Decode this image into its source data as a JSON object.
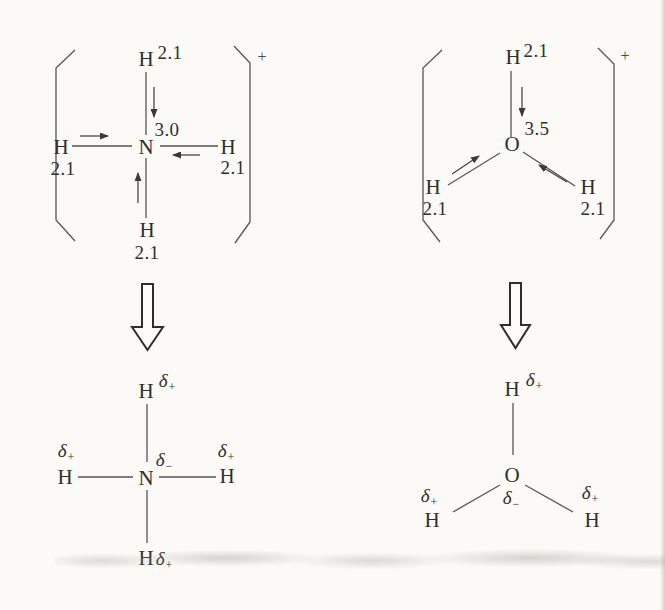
{
  "symbols": {
    "delta": "δ",
    "plus": "+",
    "minus": "−"
  },
  "top_left": {
    "charge": "+",
    "center": "N",
    "center_en": "3.0",
    "h": "H",
    "h_en": "2.1"
  },
  "top_right": {
    "charge": "+",
    "center": "O",
    "center_en": "3.5",
    "h": "H",
    "h_en": "2.1"
  },
  "bottom_left": {
    "center": "N",
    "h": "H"
  },
  "bottom_right": {
    "center": "O",
    "h": "H"
  }
}
